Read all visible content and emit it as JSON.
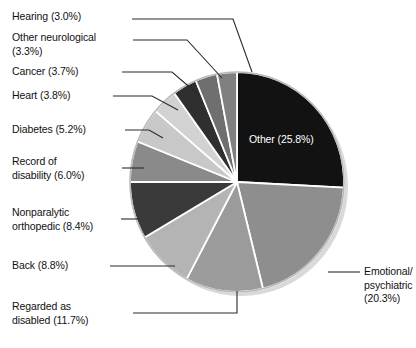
{
  "chart_data": {
    "type": "pie",
    "title": "",
    "subtitle": "",
    "xlabel": "",
    "ylabel": "",
    "legend_position": "callout-labels",
    "grid": false,
    "categories": [
      "Other",
      "Emotional/psychiatric",
      "Regarded as disabled",
      "Back",
      "Nonparalytic orthopedic",
      "Record of disability",
      "Diabetes",
      "Heart",
      "Cancer",
      "Other neurological",
      "Hearing"
    ],
    "values": [
      25.8,
      20.3,
      11.7,
      8.8,
      8.4,
      6.0,
      5.2,
      3.8,
      3.7,
      3.3,
      3.0
    ],
    "units": "percent",
    "start_angle_deg": 0,
    "direction": "clockwise",
    "slice_colors": [
      "#121212",
      "#8e8e8e",
      "#9b9b9b",
      "#b4b4b4",
      "#3a3a3a",
      "#8a8a8a",
      "#c8c8c8",
      "#d2d2d2",
      "#2f2f2f",
      "#6f6f6f",
      "#808080"
    ],
    "slice_separator_color": "#ffffff",
    "outline_color": "#b9b9b9",
    "background": "#ffffff"
  },
  "labels": {
    "hearing": "Hearing (3.0%)",
    "other_neurological": "Other neurological\n(3.3%)",
    "cancer": "Cancer (3.7%)",
    "heart": "Heart (3.8%)",
    "diabetes": "Diabetes (5.2%)",
    "record_of_disability": "Record of\ndisability (6.0%)",
    "nonparalytic_orthopedic": "Nonparalytic\northopedic (8.4%)",
    "back": "Back (8.8%)",
    "regarded_as_disabled": "Regarded as\ndisabled (11.7%)",
    "emotional_psychiatric": "Emotional/\npsychiatric\n(20.3%)",
    "other": "Other (25.8%)"
  }
}
